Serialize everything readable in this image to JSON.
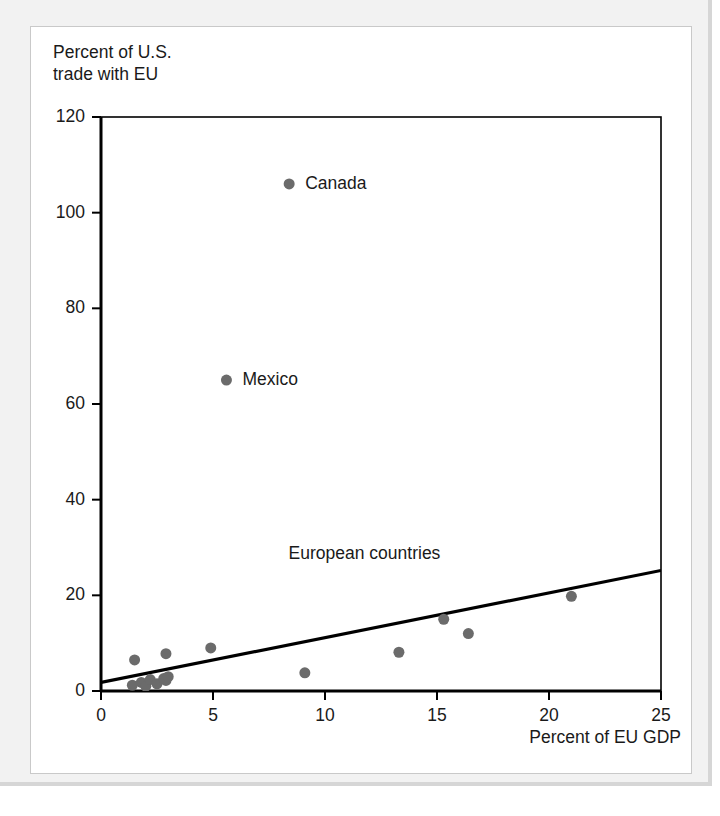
{
  "figure": {
    "background_color": "#f2f2f2",
    "card_color": "#ffffff",
    "ylabel_title": "Percent of U.S.\ntrade with EU",
    "xlabel_title": "Percent of EU GDP"
  },
  "chart_data": {
    "type": "scatter",
    "title": "",
    "subtitle": "",
    "xlabel": "Percent of EU GDP",
    "ylabel": "Percent of U.S. trade with EU",
    "xlim": [
      0,
      25
    ],
    "ylim": [
      0,
      120
    ],
    "xticks": [
      0,
      5,
      10,
      15,
      20,
      25
    ],
    "yticks": [
      0,
      20,
      40,
      60,
      80,
      100,
      120
    ],
    "xtick_labels": [
      "0",
      "5",
      "10",
      "15",
      "20",
      "25"
    ],
    "ytick_labels": [
      "0",
      "20",
      "40",
      "60",
      "80",
      "100",
      "120"
    ],
    "grid": false,
    "legend": false,
    "legend_position": "none",
    "marker_color": "#6b6b6b",
    "marker_size": 11,
    "line_color": "#000000",
    "axis_color": "#000000",
    "series": [
      {
        "name": "Countries",
        "type": "scatter",
        "points": [
          {
            "label": "Canada",
            "x": 8.4,
            "y": 106
          },
          {
            "label": "Mexico",
            "x": 5.6,
            "y": 65
          },
          {
            "label": "",
            "x": 1.5,
            "y": 6.5
          },
          {
            "label": "",
            "x": 2.9,
            "y": 7.8
          },
          {
            "label": "",
            "x": 4.9,
            "y": 9.0
          },
          {
            "label": "",
            "x": 9.1,
            "y": 3.8
          },
          {
            "label": "",
            "x": 13.3,
            "y": 8.1
          },
          {
            "label": "",
            "x": 15.3,
            "y": 15.0
          },
          {
            "label": "",
            "x": 16.4,
            "y": 12.0
          },
          {
            "label": "",
            "x": 21.0,
            "y": 19.8
          },
          {
            "label": "",
            "x": 1.4,
            "y": 1.2
          },
          {
            "label": "",
            "x": 1.8,
            "y": 1.8
          },
          {
            "label": "",
            "x": 2.0,
            "y": 1.0
          },
          {
            "label": "",
            "x": 2.2,
            "y": 2.4
          },
          {
            "label": "",
            "x": 2.5,
            "y": 1.5
          },
          {
            "label": "",
            "x": 2.8,
            "y": 2.6
          },
          {
            "label": "",
            "x": 2.9,
            "y": 2.2
          },
          {
            "label": "",
            "x": 3.0,
            "y": 3.0
          }
        ]
      },
      {
        "name": "Regression line",
        "type": "line",
        "x": [
          0,
          25
        ],
        "y": [
          1.8,
          25.2
        ]
      }
    ],
    "point_labels": [
      {
        "text": "Canada",
        "x": 8.4,
        "y": 106,
        "dx": 16,
        "dy": 0
      },
      {
        "text": "Mexico",
        "x": 5.6,
        "y": 65,
        "dx": 16,
        "dy": 0
      }
    ],
    "annotations": [
      {
        "text": "European countries",
        "x": 11.5,
        "y": 25.5
      }
    ]
  }
}
